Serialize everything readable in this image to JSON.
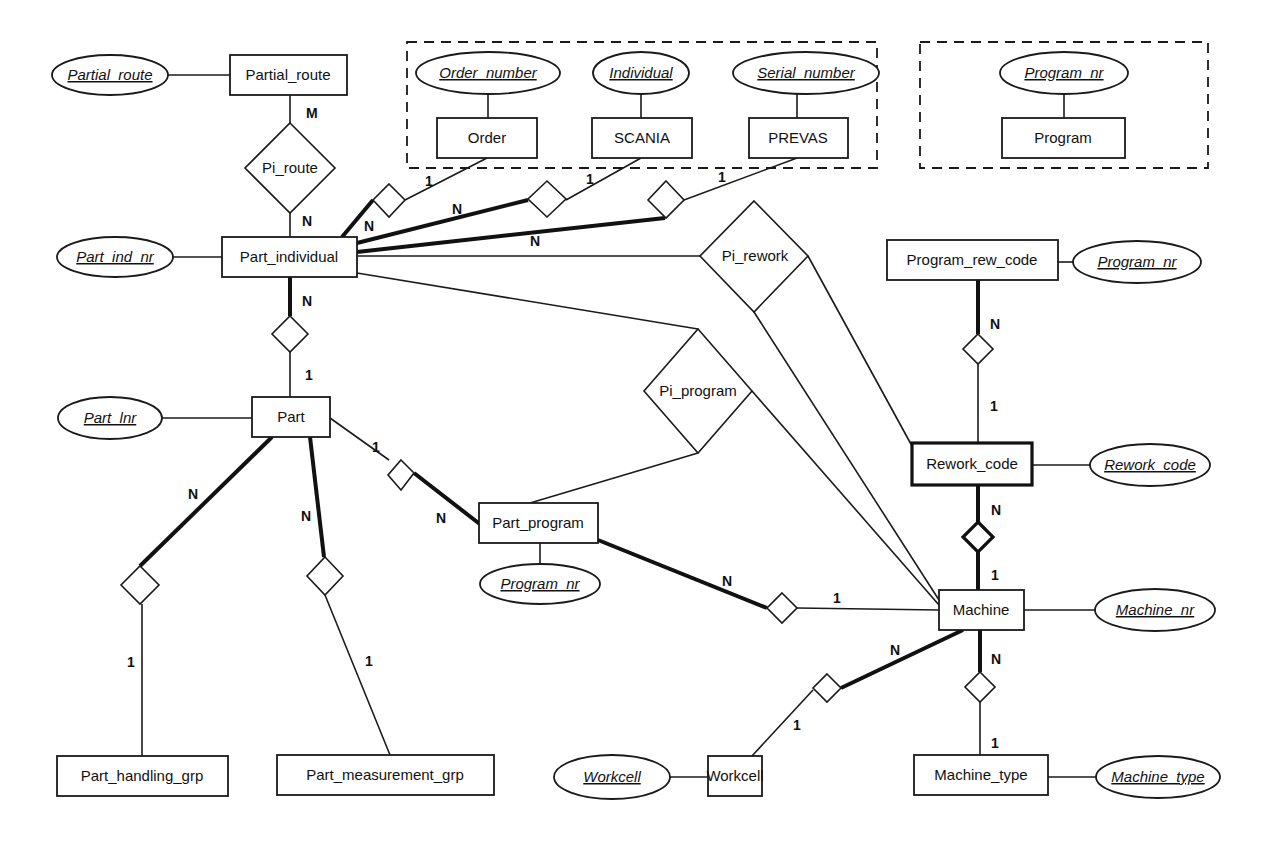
{
  "diagram": {
    "type": "entity-relationship",
    "groups": [
      {
        "id": "external_ids",
        "style": "dashed",
        "members": [
          "Order",
          "SCANIA",
          "PREVAS"
        ]
      },
      {
        "id": "program_group",
        "style": "dashed",
        "members": [
          "Program"
        ]
      }
    ],
    "entities": {
      "partial_route": "Partial_route",
      "part_individual": "Part_individual",
      "order": "Order",
      "scania": "SCANIA",
      "prevas": "PREVAS",
      "program": "Program",
      "program_rew_code": "Program_rew_code",
      "rework_code": "Rework_code",
      "part": "Part",
      "part_program": "Part_program",
      "machine": "Machine",
      "part_handling_grp": "Part_handling_grp",
      "part_measurement_grp": "Part_measurement_grp",
      "workcell": "Workcell",
      "machine_type": "Machine_type"
    },
    "attributes": {
      "partial_route": "Partial_route",
      "part_ind_nr": "Part_ind_nr",
      "order_number": "Order_number",
      "individual": "Individual",
      "serial_number": "Serial_number",
      "program_nr_group": "Program_nr",
      "program_nr_rew": "Program_nr",
      "rework_code": "Rework_code",
      "part_lnr": "Part_lnr",
      "program_nr_part": "Program_nr",
      "machine_nr": "Machine_nr",
      "workcell": "Workcell",
      "machine_type": "Machine_type"
    },
    "relationships": {
      "pi_route": "Pi_route",
      "pi_rework": "Pi_rework",
      "pi_program": "Pi_program"
    },
    "cardinalities": {
      "partial_route_pi_route": "M",
      "pi_route_part_individual": "N",
      "order_side": "1",
      "order_pi_side": "N",
      "scania_side": "1",
      "scania_pi_side": "N",
      "prevas_side": "1",
      "prevas_pi_side": "N",
      "pi_part_n": "N",
      "part_pi_1": "1",
      "part_handling_n": "N",
      "handling_1": "1",
      "part_measure_n": "N",
      "measure_1": "1",
      "part_partprog_1": "1",
      "partprog_part_n": "N",
      "partprog_machine_n": "N",
      "machine_partprog_1": "1",
      "progrew_n": "N",
      "progrew_rework_1": "1",
      "rework_machine_n": "N",
      "machine_rework_1": "1",
      "machine_workcell_n": "N",
      "workcell_1": "1",
      "machine_type_n": "N",
      "machine_type_1": "1"
    }
  }
}
